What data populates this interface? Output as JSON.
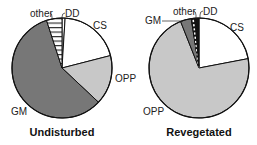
{
  "chart_data": [
    {
      "type": "pie",
      "title": "Undisturbed",
      "start_angle_deg": 0,
      "direction": "clockwise",
      "slices": [
        {
          "label": "DD",
          "value": 1,
          "fill": "#ffffff",
          "pattern": "none"
        },
        {
          "label": "CS",
          "value": 20,
          "fill": "#ffffff",
          "pattern": "none"
        },
        {
          "label": "OPP",
          "value": 16,
          "fill": "#c8c8c8",
          "pattern": "none"
        },
        {
          "label": "GM",
          "value": 58,
          "fill": "#777777",
          "pattern": "none"
        },
        {
          "label": "other",
          "value": 5,
          "fill": "#ffffff",
          "pattern": "horizontal-lines"
        }
      ]
    },
    {
      "type": "pie",
      "title": "Revegetated",
      "start_angle_deg": 0,
      "direction": "clockwise",
      "slices": [
        {
          "label": "CS",
          "value": 22,
          "fill": "#ffffff",
          "pattern": "none"
        },
        {
          "label": "OPP",
          "value": 72,
          "fill": "#c8c8c8",
          "pattern": "none"
        },
        {
          "label": "GM",
          "value": 3.5,
          "fill": "#777777",
          "pattern": "none"
        },
        {
          "label": "other",
          "value": 1.2,
          "fill": "#ffffff",
          "pattern": "dashed-white"
        },
        {
          "label": "DD",
          "value": 1.3,
          "fill": "#111111",
          "pattern": "none"
        }
      ]
    }
  ],
  "labels": {
    "left": {
      "other": "other",
      "dd": "DD",
      "cs": "CS",
      "opp": "OPP",
      "gm": "GM",
      "title": "Undisturbed"
    },
    "right": {
      "other": "other",
      "dd": "DD",
      "cs": "CS",
      "opp": "OPP",
      "gm": "GM",
      "title": "Revegetated"
    }
  }
}
